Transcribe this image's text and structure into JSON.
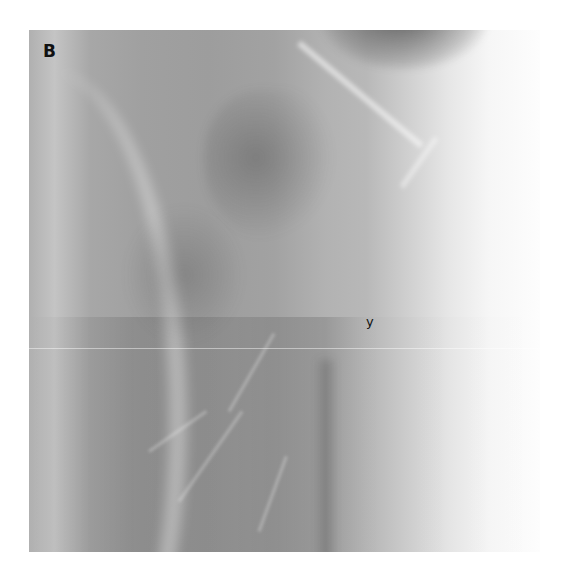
{
  "figure": {
    "panel_label": "B",
    "annotations": [
      {
        "text": "y"
      }
    ],
    "colors": {
      "background": "#ffffff",
      "image_dark": "#9d9d9d",
      "image_light": "#fdfdfd",
      "label": "#111111"
    }
  }
}
